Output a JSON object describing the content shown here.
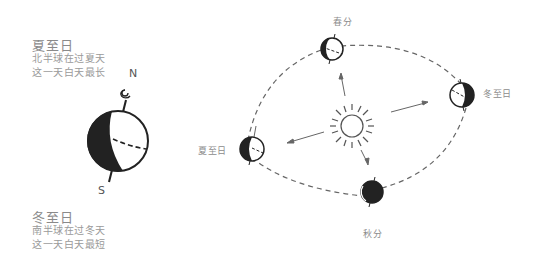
{
  "left_panel": {
    "summer": {
      "title": "夏至日",
      "lines": [
        "北半球在过夏天",
        "这一天白天最长"
      ]
    },
    "winter": {
      "title": "冬至日",
      "lines": [
        "南半球在过冬天",
        "这一天白天最短"
      ]
    },
    "globe": {
      "north_label": "N",
      "south_label": "S"
    }
  },
  "orbit": {
    "positions": [
      {
        "id": "spring",
        "label": "春分"
      },
      {
        "id": "winter-solstice",
        "label": "冬至日"
      },
      {
        "id": "summer-solstice",
        "label": "夏至日"
      },
      {
        "id": "autumn",
        "label": "秋分"
      }
    ],
    "center": "sun-icon"
  },
  "colors": {
    "line": "#555555",
    "dark": "#222222",
    "text": "#8a8a8a"
  }
}
